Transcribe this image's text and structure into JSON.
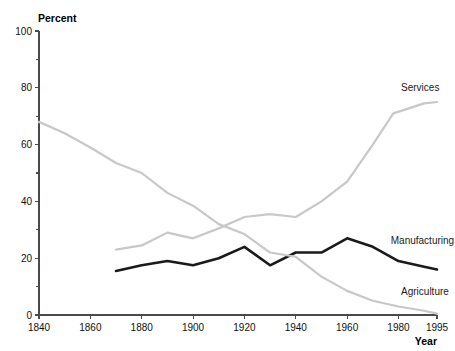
{
  "chart": {
    "type": "line",
    "title": "",
    "xlabel": "Year",
    "ylabel": "Percent",
    "ylim": [
      0,
      100
    ],
    "xlim": [
      1840,
      1995
    ],
    "grid": false,
    "legend_position": "inline-right-labels",
    "y_ticks_major": [
      0,
      20,
      40,
      60,
      80,
      100
    ],
    "y_ticks_minor": [
      10,
      30,
      50,
      70,
      90
    ],
    "x_ticks": [
      1840,
      1860,
      1880,
      1900,
      1920,
      1940,
      1960,
      1980,
      1995
    ],
    "colors": {
      "services": "#c8c8c8",
      "manufacturing": "#1a1a1a",
      "agriculture": "#c8c8c8",
      "axis": "#4a4a4a",
      "text": "#111111",
      "background": "#ffffff"
    }
  },
  "chart_data": {
    "type": "line",
    "title": "",
    "xlabel": "Year",
    "ylabel": "Percent",
    "ylim": [
      0,
      100
    ],
    "xlim": [
      1840,
      1995
    ],
    "grid": false,
    "legend_position": "inline-right-labels",
    "x_tick_labels": [
      "1840",
      "1860",
      "1880",
      "1900",
      "1920",
      "1940",
      "1960",
      "1980",
      "1995"
    ],
    "y_tick_labels": [
      "0",
      "20",
      "40",
      "60",
      "80",
      "100"
    ],
    "series": [
      {
        "name": "Services",
        "color": "#c8c8c8",
        "x": [
          1870,
          1880,
          1890,
          1900,
          1910,
          1920,
          1930,
          1940,
          1950,
          1960,
          1970,
          1978,
          1990,
          1995
        ],
        "values": [
          23,
          24.5,
          29,
          27,
          30.5,
          34.5,
          35.5,
          34.5,
          40,
          47,
          60,
          71,
          74.5,
          75
        ]
      },
      {
        "name": "Manufacturing",
        "color": "#1a1a1a",
        "x": [
          1870,
          1880,
          1890,
          1900,
          1910,
          1920,
          1930,
          1940,
          1950,
          1960,
          1970,
          1980,
          1990,
          1995
        ],
        "values": [
          15.5,
          17.5,
          19,
          17.5,
          20,
          24,
          17.5,
          22,
          22,
          27,
          24,
          19,
          17,
          16
        ]
      },
      {
        "name": "Agriculture",
        "color": "#c8c8c8",
        "x": [
          1840,
          1850,
          1860,
          1870,
          1880,
          1890,
          1900,
          1910,
          1920,
          1930,
          1940,
          1950,
          1960,
          1970,
          1980,
          1990,
          1995
        ],
        "values": [
          68,
          64,
          59,
          53.5,
          50,
          43,
          38.5,
          32,
          28.5,
          22,
          20.5,
          13.5,
          8.5,
          5,
          3,
          1.5,
          0.5
        ]
      }
    ],
    "annotations": [
      {
        "text": "Services",
        "x": 1981,
        "y": 79
      },
      {
        "text": "Manufacturing",
        "x": 1977,
        "y": 25
      },
      {
        "text": "Agriculture",
        "x": 1981,
        "y": 7
      }
    ]
  }
}
